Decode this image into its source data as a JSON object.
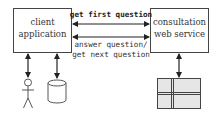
{
  "diagram": {
    "nodes": {
      "client": {
        "line1": "client",
        "line2": "application"
      },
      "service": {
        "line1": "consultation",
        "line2": "web service"
      },
      "user": {
        "kind": "actor"
      },
      "database": {
        "kind": "cylinder"
      },
      "table": {
        "kind": "table-grid"
      }
    },
    "edges": {
      "top": {
        "label": "get first question"
      },
      "bottom": {
        "label_line1": "answer question/",
        "label_line2": "get next question"
      }
    },
    "colors": {
      "stroke": "#333333",
      "table_fill": "#e6e6e6",
      "background": "#ffffff"
    }
  }
}
